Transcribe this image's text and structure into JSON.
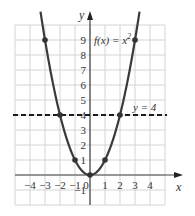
{
  "chart_data": {
    "type": "line",
    "title": "",
    "xlabel": "x",
    "ylabel": "y",
    "xlim": [
      -5,
      5
    ],
    "ylim": [
      -2,
      10
    ],
    "grid": true,
    "x_ticks": [
      -4,
      -3,
      -2,
      -1,
      0,
      1,
      2,
      3,
      4
    ],
    "x_tick_labels": [
      "−4",
      "−3",
      "−2",
      "−1",
      "0",
      "1",
      "2",
      "3",
      "4"
    ],
    "y_ticks": [
      -1,
      1,
      2,
      3,
      4,
      5,
      6,
      7,
      8,
      9
    ],
    "y_tick_labels": [
      "−1",
      "1",
      "2",
      "3",
      "4",
      "5",
      "6",
      "7",
      "8",
      "9"
    ],
    "series": [
      {
        "name": "f(x) = x²",
        "kind": "curve",
        "function": "x^2",
        "domain": [
          -3.3,
          3.3
        ],
        "color": "#3a3a3a",
        "points": [
          {
            "x": -3,
            "y": 9
          },
          {
            "x": -2,
            "y": 4
          },
          {
            "x": -1,
            "y": 1
          },
          {
            "x": 0,
            "y": 0
          },
          {
            "x": 1,
            "y": 1
          },
          {
            "x": 2,
            "y": 4
          },
          {
            "x": 3,
            "y": 9
          }
        ]
      },
      {
        "name": "y = 4",
        "kind": "horizontal-dashed-line",
        "y": 4,
        "color": "#1a1a1a"
      }
    ],
    "annotations": [
      {
        "text": "f(x) = x",
        "superscript": "2",
        "x": 0.2,
        "y": 9
      },
      {
        "text": "y = 4",
        "x": 2.4,
        "y": 4.4
      }
    ]
  },
  "labels": {
    "x_axis": "x",
    "y_axis": "y",
    "func_main": "f(x) = x",
    "func_sup": "2",
    "line_label": "y = 4"
  }
}
